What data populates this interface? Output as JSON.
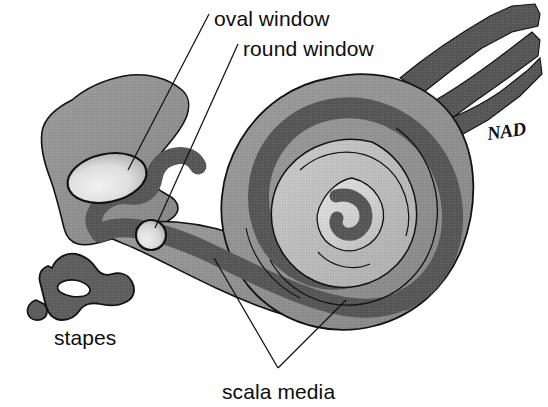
{
  "figure": {
    "background_color": "#ffffff",
    "width": 548,
    "height": 407
  },
  "labels": {
    "oval_window": "oval window",
    "round_window": "round window",
    "stapes": "stapes",
    "scala_media": "scala media",
    "signature": "NAD"
  },
  "colors": {
    "outline": "#111111",
    "bone_mid_gray": "#8f8f8f",
    "scala_dark_gray": "#565656",
    "inner_light_gray": "#bcbcbc",
    "inner_lightest_gray": "#d2d2d2",
    "window_highlight": "#e8e8e8",
    "nerve_dark_gray": "#565656",
    "stapes_gray": "#5e5e5e",
    "label_text": "#0d0d0d",
    "leader_line": "#111111"
  },
  "structures": [
    {
      "name": "vestibule",
      "fill": "bone_mid_gray"
    },
    {
      "name": "oval-window",
      "fill": "window_highlight"
    },
    {
      "name": "round-window",
      "fill": "window_highlight"
    },
    {
      "name": "cochlea-outer-turn",
      "fill": "bone_mid_gray"
    },
    {
      "name": "scala-media-spiral",
      "fill": "scala_dark_gray"
    },
    {
      "name": "cochlea-inner-turn",
      "fill": "inner_light_gray"
    },
    {
      "name": "cochlea-apex",
      "fill": "inner_lightest_gray"
    },
    {
      "name": "vestibulocochlear-nerve",
      "fill": "nerve_dark_gray"
    },
    {
      "name": "stapes",
      "fill": "stapes_gray"
    }
  ]
}
